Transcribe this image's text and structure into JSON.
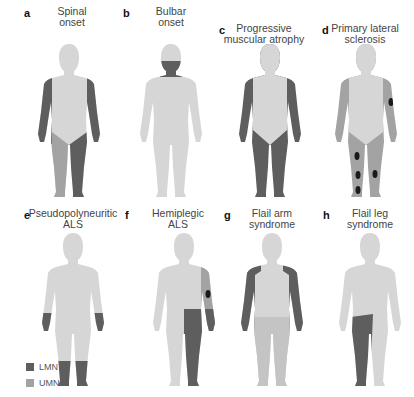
{
  "colors": {
    "body": "#d6d6d6",
    "lmn": "#5e5e5e",
    "umn": "#a3a3a3",
    "lesion": "#1a1a1a"
  },
  "panels": [
    {
      "letter": "a",
      "title": "Spinal\nonset"
    },
    {
      "letter": "b",
      "title": "Bulbar\nonset"
    },
    {
      "letter": "c",
      "title": "Progressive\nmuscular atrophy"
    },
    {
      "letter": "d",
      "title": "Primary lateral\nsclerosis"
    },
    {
      "letter": "e",
      "title": "Pseudopolyneuritic\nALS"
    },
    {
      "letter": "f",
      "title": "Hemiplegic\nALS"
    },
    {
      "letter": "g",
      "title": "Flail arm\nsyndrome"
    },
    {
      "letter": "h",
      "title": "Flail leg\nsyndrome"
    }
  ],
  "legend": [
    {
      "label": "LMN",
      "color": "#5e5e5e"
    },
    {
      "label": "UMN",
      "color": "#a3a3a3"
    }
  ]
}
